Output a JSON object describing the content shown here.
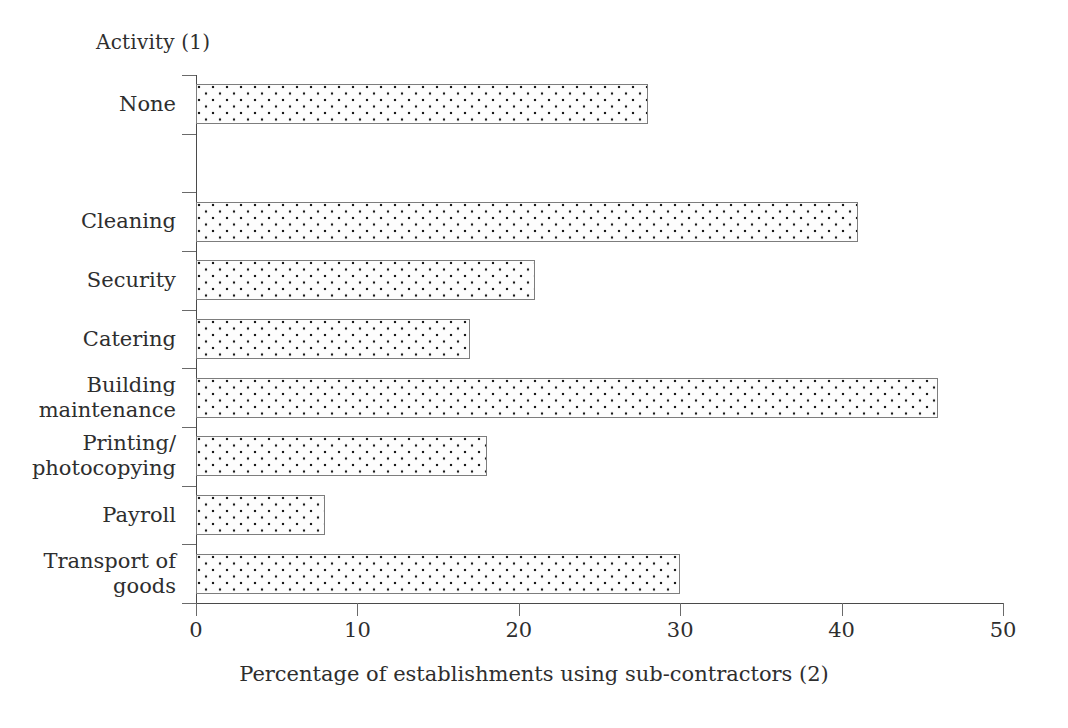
{
  "chart_data": {
    "type": "bar",
    "orientation": "horizontal",
    "title": "",
    "ylabel": "Activity (1)",
    "xlabel": "Percentage of establishments using sub-contractors (2)",
    "categories": [
      "None",
      "",
      "Cleaning",
      "Security",
      "Catering",
      "Building maintenance",
      "Printing/ photocopying",
      "Payroll",
      "Transport of goods"
    ],
    "category_lines": [
      [
        "None"
      ],
      [
        ""
      ],
      [
        "Cleaning"
      ],
      [
        "Security"
      ],
      [
        "Catering"
      ],
      [
        "Building",
        "maintenance"
      ],
      [
        "Printing/",
        "photocopying"
      ],
      [
        "Payroll"
      ],
      [
        "Transport of",
        "goods"
      ]
    ],
    "values": [
      28,
      null,
      41,
      21,
      17,
      46,
      18,
      8,
      30
    ],
    "xlim": [
      0,
      50
    ],
    "xticks": [
      0,
      10,
      20,
      30,
      40,
      50
    ],
    "xtick_labels": [
      "0",
      "10",
      "20",
      "30",
      "40",
      "50"
    ],
    "grid": false,
    "legend": false,
    "bar_fill": "dotted-pattern",
    "bar_edge_color": "#7d7d7d",
    "bar_dot_color": "#1a1a1a",
    "axis_color": "#4a4a4a",
    "text_color": "#2e2e2e",
    "background": "#ffffff"
  },
  "axis": {
    "y_title": "Activity (1)",
    "x_caption": "Percentage of establishments using sub-contractors (2)"
  }
}
